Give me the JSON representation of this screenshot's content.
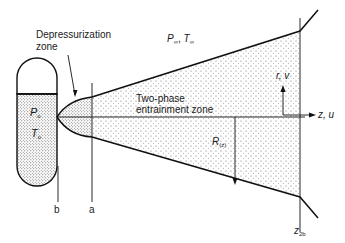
{
  "figure": {
    "labels": {
      "depressurization_zone_line1": "Depressurization",
      "depressurization_zone_line2": "zone",
      "ambient_P": "P",
      "ambient_P_sub": "∞",
      "ambient_sep": ", ",
      "ambient_T": "T",
      "ambient_T_sub": "∞",
      "two_phase_line1": "Two-phase",
      "two_phase_line2": "entrainment zone",
      "tank_P": "P",
      "tank_P_sub": "o",
      "tank_T": "T",
      "tank_T_sub": "o",
      "radius": "R",
      "radius_sub": "(z)",
      "axis_r": "r, v",
      "axis_z": "z, u",
      "plane_b": "b",
      "plane_a": "a",
      "plane_z": "z",
      "plane_z_sub": "2b"
    },
    "colors": {
      "line": "#111111",
      "text": "#1a1a1a",
      "stipple": "#444444"
    }
  }
}
